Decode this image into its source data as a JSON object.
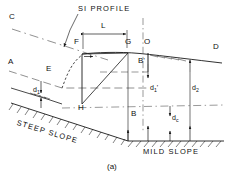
{
  "figure": {
    "caption": "(a)",
    "annotation": "SI PROFILE",
    "type": "hydraulic water surface profile diagram"
  },
  "points": {
    "C": "C",
    "A": "A",
    "E": "E",
    "F": "F",
    "G": "G",
    "O": "O",
    "D": "D",
    "H": "H",
    "B": "B",
    "B_prime": "B'"
  },
  "dimensions": {
    "L": "L",
    "d1": "d",
    "d1_sub": "1",
    "d1_prime": "d",
    "d1_prime_sub": "1",
    "d1_prime_mark": "'",
    "d2": "d",
    "d2_sub": "2",
    "dc": "d",
    "dc_sub": "c"
  },
  "slopes": {
    "steep": "STEEP SLOPE",
    "mild": "MILD SLOPE"
  },
  "colors": {
    "line": "#1a1a1a",
    "background": "#ffffff",
    "dashed": "#555555"
  }
}
